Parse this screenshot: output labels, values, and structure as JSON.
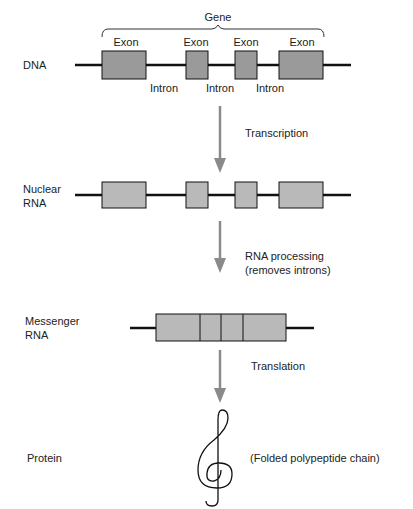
{
  "colors": {
    "line": "#111111",
    "dna_exon_fill": "#9a9a9a",
    "rna_exon_fill": "#b9b9b9",
    "arrow": "#8a8a8a",
    "text": "#222222"
  },
  "gene_label": "Gene",
  "stages": {
    "dna": {
      "label": "DNA",
      "exon_labels": [
        "Exon",
        "Exon",
        "Exon",
        "Exon"
      ],
      "intron_labels": [
        "Intron",
        "Intron",
        "Intron"
      ]
    },
    "nuclear_rna": {
      "label_line1": "Nuclear",
      "label_line2": "RNA"
    },
    "messenger_rna": {
      "label_line1": "Messenger",
      "label_line2": "RNA"
    },
    "protein": {
      "label": "Protein",
      "description": "(Folded polypeptide chain)"
    }
  },
  "steps": {
    "transcription": "Transcription",
    "rna_processing_line1": "RNA processing",
    "rna_processing_line2": "(removes introns)",
    "translation": "Translation"
  }
}
